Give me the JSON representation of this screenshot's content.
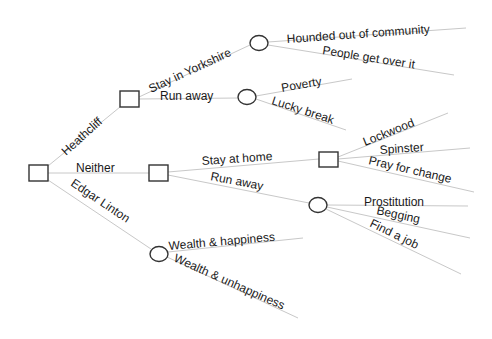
{
  "diagram": {
    "type": "decision-tree",
    "colors": {
      "edge": "#c8c8c8",
      "node_stroke": "#333333",
      "text": "#1a1a1a",
      "background": "#ffffff"
    },
    "root": {
      "shape": "decision-square"
    },
    "level1": {
      "heathcliff": "Heathcliff",
      "neither": "Neither",
      "edgar_linton": "Edgar Linton"
    },
    "heathcliff_branch": {
      "stay_in_yorkshire": "Stay in Yorkshire",
      "run_away": "Run away",
      "yorkshire_outcomes": [
        "Hounded out of community",
        "People get over it"
      ],
      "run_away_outcomes": [
        "Poverty",
        "Lucky break"
      ]
    },
    "neither_branch": {
      "stay_at_home": "Stay at home",
      "run_away": "Run away",
      "home_outcomes": [
        "Lockwood",
        "Spinster",
        "Pray for change"
      ],
      "run_away_outcomes": [
        "Prostitution",
        "Begging",
        "Find a job"
      ]
    },
    "edgar_branch": {
      "outcomes": [
        "Wealth & happiness",
        "Wealth & unhappiness"
      ]
    }
  }
}
